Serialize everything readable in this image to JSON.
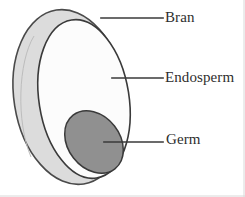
{
  "figure": {
    "background_color": "#ffffff"
  },
  "diagram": {
    "type": "anatomical-cutaway",
    "parts": [
      {
        "id": "bran",
        "label": "Bran",
        "shape": "outer-ellipse-rim",
        "fill_color": "#dcdcdc",
        "stroke_color": "#4a4a4a",
        "description": "Light gray outer crescent layer forming the kernel husk"
      },
      {
        "id": "endosperm",
        "label": "Endosperm",
        "shape": "inner-ellipse",
        "fill_color": "#fcfcfc",
        "stroke_color": "#3a3a3a",
        "description": "White interior body occupying most of the kernel"
      },
      {
        "id": "germ",
        "label": "Germ",
        "shape": "tilted-ellipse",
        "fill_color": "#909090",
        "stroke_color": "#3a3a3a",
        "description": "Medium gray oval in the lower right of the endosperm"
      }
    ]
  },
  "labels": {
    "bran": "Bran",
    "endosperm": "Endosperm",
    "germ": "Germ"
  },
  "leader_lines": [
    {
      "id": "leader-bran",
      "from_x": 101,
      "from_y": 18,
      "to_x": 163,
      "to_y": 18
    },
    {
      "id": "leader-endosperm",
      "from_x": 112,
      "from_y": 78,
      "to_x": 163,
      "to_y": 78
    },
    {
      "id": "leader-germ",
      "from_x": 104,
      "from_y": 142,
      "to_x": 163,
      "to_y": 142
    }
  ],
  "colors": {
    "bran_fill": "#dcdcdc",
    "endosperm_fill": "#fcfcfc",
    "germ_fill": "#909090",
    "outline": "#3f3f3f",
    "leader_line": "#3a3a3a",
    "text": "#2e2e2e",
    "border": "#d8d8d8"
  }
}
